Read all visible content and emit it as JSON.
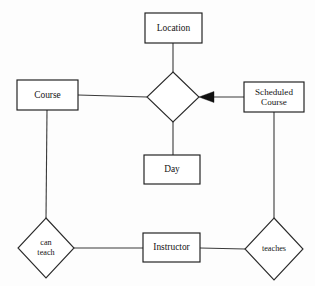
{
  "diagram": {
    "kind": "entity-relationship-diagram",
    "background_color": "#fdfdfd",
    "line_color": "#3a3a3a",
    "text_color": "#141414",
    "entities": [
      {
        "id": "location",
        "label": "Location",
        "lines": [
          "Location"
        ],
        "shape": "rectangle",
        "x": 145,
        "y": 13,
        "width": 57,
        "height": 30
      },
      {
        "id": "course",
        "label": "Course",
        "lines": [
          "Course"
        ],
        "shape": "rectangle",
        "x": 17,
        "y": 80,
        "width": 61,
        "height": 30
      },
      {
        "id": "scheduled-course",
        "label": "Scheduled Course",
        "lines": [
          "Scheduled",
          "Course"
        ],
        "shape": "rectangle",
        "x": 244,
        "y": 82,
        "width": 60,
        "height": 30
      },
      {
        "id": "day",
        "label": "Day",
        "lines": [
          "Day"
        ],
        "shape": "rectangle",
        "x": 144,
        "y": 155,
        "width": 56,
        "height": 29
      },
      {
        "id": "instructor",
        "label": "Instructor",
        "lines": [
          "Instructor"
        ],
        "shape": "rectangle",
        "x": 143,
        "y": 233,
        "width": 57,
        "height": 29
      }
    ],
    "relationships": [
      {
        "id": "schedule",
        "label": "",
        "lines": [],
        "shape": "diamond",
        "cx": 173,
        "cy": 97,
        "rx": 26,
        "ry": 25
      },
      {
        "id": "can-teach",
        "label": "can teach",
        "lines": [
          "can",
          "teach"
        ],
        "shape": "diamond",
        "cx": 46,
        "cy": 248,
        "rx": 28,
        "ry": 30
      },
      {
        "id": "teaches",
        "label": "teaches",
        "lines": [
          "teaches"
        ],
        "shape": "diamond",
        "cx": 274,
        "cy": 249,
        "rx": 29,
        "ry": 31
      }
    ],
    "connectors": [
      {
        "id": "location-to-schedule",
        "from": "location",
        "to": "schedule",
        "x1": 173,
        "y1": 43,
        "x2": 173,
        "y2": 72,
        "arrow": false
      },
      {
        "id": "course-to-schedule",
        "from": "course",
        "to": "schedule",
        "x1": 78,
        "y1": 95,
        "x2": 147,
        "y2": 97,
        "arrow": false
      },
      {
        "id": "scheduled-course-to-schedule",
        "from": "scheduled-course",
        "to": "schedule",
        "x1": 244,
        "y1": 97,
        "x2": 199,
        "y2": 97,
        "arrow": true,
        "arrow_at": "schedule"
      },
      {
        "id": "schedule-to-day",
        "from": "schedule",
        "to": "day",
        "x1": 173,
        "y1": 122,
        "x2": 173,
        "y2": 155,
        "arrow": false
      },
      {
        "id": "course-to-can-teach",
        "from": "course",
        "to": "can-teach",
        "x1": 47,
        "y1": 110,
        "x2": 46,
        "y2": 218,
        "arrow": false
      },
      {
        "id": "can-teach-to-instructor",
        "from": "can-teach",
        "to": "instructor",
        "x1": 74,
        "y1": 248,
        "x2": 143,
        "y2": 248,
        "arrow": false
      },
      {
        "id": "instructor-to-teaches",
        "from": "instructor",
        "to": "teaches",
        "x1": 200,
        "y1": 248,
        "x2": 245,
        "y2": 249,
        "arrow": false
      },
      {
        "id": "scheduled-course-to-teaches",
        "from": "scheduled-course",
        "to": "teaches",
        "x1": 274,
        "y1": 111,
        "x2": 274,
        "y2": 218,
        "arrow": false
      }
    ],
    "arrow_marker": {
      "id": "relationship-arrowhead",
      "points": "199,97 213,92 213,102",
      "direction": "left",
      "color": "#101010"
    }
  }
}
